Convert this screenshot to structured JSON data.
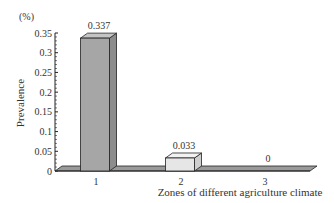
{
  "chart_data": {
    "type": "bar",
    "style": "3d",
    "title": "",
    "unit_label": "(%)",
    "xlabel": "Zones of different agriculture climate",
    "ylabel": "Prevalence",
    "categories": [
      "1",
      "2",
      "3"
    ],
    "values": [
      0.337,
      0.033,
      0
    ],
    "value_labels": [
      "0.337",
      "0.033",
      "0"
    ],
    "ylim": [
      0,
      0.35
    ],
    "yticks": [
      0,
      0.05,
      0.1,
      0.15,
      0.2,
      0.25,
      0.3,
      0.35
    ],
    "ytick_labels": [
      "0",
      "0.05",
      "0.1",
      "0.15",
      "0.2",
      "0.25",
      "0.3",
      "0.35"
    ],
    "grid": false,
    "legend": null,
    "colors": {
      "bar1_front": "#a6a6a6",
      "bar1_side": "#8c8c8c",
      "bar1_top": "#c4c4c4",
      "bar2_front": "#e6e6e6",
      "bar2_side": "#cfcfcf",
      "bar2_top": "#f2f2f2",
      "floor": "#9a9a9a",
      "outline": "#222222"
    }
  }
}
